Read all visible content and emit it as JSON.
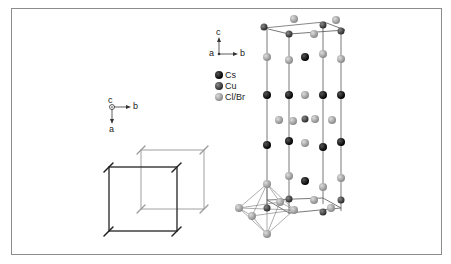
{
  "figure": {
    "axes_small": {
      "c": "c",
      "a": "a",
      "b": "b"
    },
    "axes_top": {
      "c": "c",
      "a": "a",
      "b": "b"
    },
    "legend": [
      {
        "label": "Cs",
        "color": "#111111"
      },
      {
        "label": "Cu",
        "color": "#444444"
      },
      {
        "label": "Cl/Br",
        "color": "#a8a8a8"
      }
    ]
  }
}
